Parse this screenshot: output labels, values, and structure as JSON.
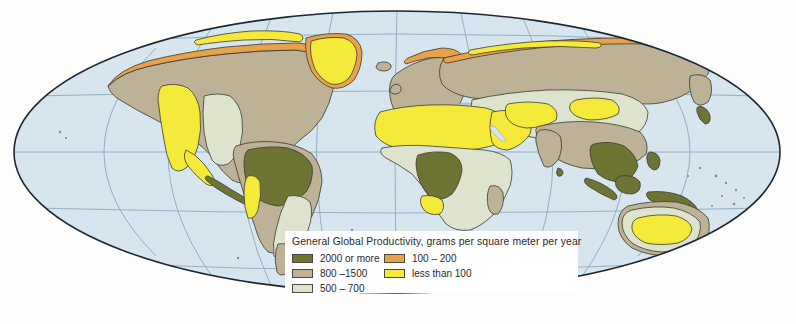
{
  "figure": {
    "kind": "thematic-world-map",
    "projection": "mollweide-oval",
    "background_color": "#fdfdfb",
    "ocean_color": "#d6e5ee",
    "graticule_color": "#8fa8bd",
    "outline_color": "#1c2733",
    "coast_color": "#3a3a34"
  },
  "legend": {
    "title": "General Global Productivity, grams per square meter per year",
    "box_color": "#ffffff",
    "columns": [
      {
        "items": [
          {
            "label": "2000 or more",
            "color": "#6e7434",
            "name": "class-2000-or-more"
          },
          {
            "label": "800 –1500",
            "color": "#bdb295",
            "name": "class-800-1500"
          },
          {
            "label": "500 – 700",
            "color": "#dde3cd",
            "name": "class-500-700"
          }
        ]
      },
      {
        "items": [
          {
            "label": "100 – 200",
            "color": "#e8a24a",
            "name": "class-100-200"
          },
          {
            "label": "less than 100",
            "color": "#f5e93a",
            "name": "class-less-than-100"
          }
        ]
      }
    ]
  },
  "map_regions": [
    {
      "name": "arctic-north-america",
      "class": "100 – 200"
    },
    {
      "name": "greenland",
      "class": "less than 100"
    },
    {
      "name": "boreal-north-america",
      "class": "800 –1500"
    },
    {
      "name": "western-north-america-arid",
      "class": "less than 100"
    },
    {
      "name": "great-plains",
      "class": "500 – 700"
    },
    {
      "name": "central-america",
      "class": "2000 or more"
    },
    {
      "name": "amazon-basin",
      "class": "2000 or more"
    },
    {
      "name": "south-america-transition",
      "class": "800 –1500"
    },
    {
      "name": "atacama-coast",
      "class": "less than 100"
    },
    {
      "name": "southern-cone",
      "class": "500 – 700"
    },
    {
      "name": "sahara",
      "class": "less than 100"
    },
    {
      "name": "arabian-peninsula",
      "class": "less than 100"
    },
    {
      "name": "congo-basin",
      "class": "2000 or more"
    },
    {
      "name": "sub-saharan-africa",
      "class": "500 – 700"
    },
    {
      "name": "namib-kalahari",
      "class": "less than 100"
    },
    {
      "name": "madagascar",
      "class": "800 –1500"
    },
    {
      "name": "scandinavia-arctic-coast",
      "class": "100 – 200"
    },
    {
      "name": "siberian-arctic-coast",
      "class": "100 – 200"
    },
    {
      "name": "siberian-taiga",
      "class": "800 –1500"
    },
    {
      "name": "central-asia",
      "class": "500 – 700"
    },
    {
      "name": "gobi-taklamakan",
      "class": "less than 100"
    },
    {
      "name": "europe",
      "class": "800 –1500"
    },
    {
      "name": "india-east-china",
      "class": "800 –1500"
    },
    {
      "name": "southeast-asia",
      "class": "2000 or more"
    },
    {
      "name": "indonesia",
      "class": "2000 or more"
    },
    {
      "name": "new-guinea",
      "class": "2000 or more"
    },
    {
      "name": "australia-interior",
      "class": "less than 100"
    },
    {
      "name": "australia-margin",
      "class": "500 – 700"
    },
    {
      "name": "australia-coast",
      "class": "800 –1500"
    },
    {
      "name": "new-zealand",
      "class": "800 –1500"
    }
  ]
}
